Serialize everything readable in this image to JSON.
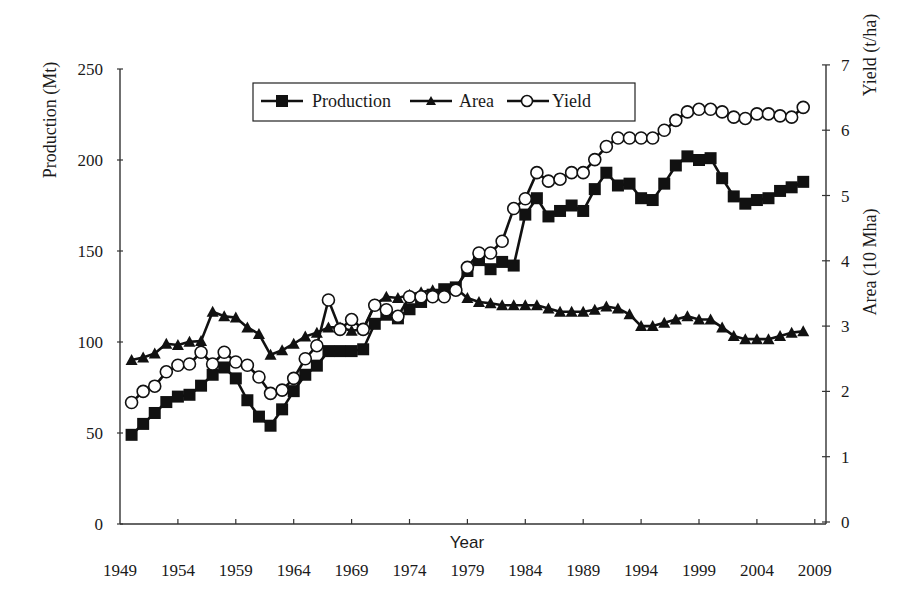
{
  "chart_data": {
    "type": "line",
    "title": "",
    "xlabel": "Year",
    "ylabel_left": "Production (Mt)",
    "ylabel_right_top": "Yield (t/ha)",
    "ylabel_right_bottom": "Area (10 Mha)",
    "xlim": [
      1949,
      2011
    ],
    "ylim_left": [
      0,
      250
    ],
    "ylim_right": [
      0,
      7
    ],
    "x_tick_labels": [
      "1949",
      "1954",
      "1959",
      "1964",
      "1969",
      "1974",
      "1979",
      "1984",
      "1989",
      "1994",
      "1999",
      "2004",
      "2009"
    ],
    "left_tick_labels": [
      "0",
      "50",
      "100",
      "150",
      "200",
      "250"
    ],
    "right_tick_labels": [
      "0",
      "1",
      "2",
      "3",
      "4",
      "5",
      "6",
      "7"
    ],
    "grid": false,
    "legend": {
      "position": "top-center",
      "entries": [
        "Production",
        "Area",
        "Yield"
      ]
    },
    "x": [
      1950,
      1951,
      1952,
      1953,
      1954,
      1955,
      1956,
      1957,
      1958,
      1959,
      1960,
      1961,
      1962,
      1963,
      1964,
      1965,
      1966,
      1967,
      1968,
      1969,
      1970,
      1971,
      1972,
      1973,
      1974,
      1975,
      1976,
      1977,
      1978,
      1979,
      1980,
      1981,
      1982,
      1983,
      1984,
      1985,
      1986,
      1987,
      1988,
      1989,
      1990,
      1991,
      1992,
      1993,
      1994,
      1995,
      1996,
      1997,
      1998,
      1999,
      2000,
      2001,
      2002,
      2003,
      2004,
      2005,
      2006,
      2007,
      2008
    ],
    "series": [
      {
        "name": "Production",
        "axis": "left",
        "marker": "square",
        "values": [
          49,
          55,
          61,
          67,
          70,
          71,
          76,
          82,
          86,
          80,
          68,
          59,
          54,
          63,
          73,
          82,
          87,
          95,
          95,
          95,
          96,
          110,
          115,
          113,
          118,
          122,
          126,
          129,
          130,
          139,
          145,
          140,
          144,
          142,
          170,
          179,
          169,
          172,
          175,
          172,
          184,
          193,
          186,
          187,
          179,
          178,
          187,
          197,
          202,
          200,
          201,
          190,
          180,
          176,
          178,
          179,
          183,
          185,
          188
        ]
      },
      {
        "name": "Area",
        "axis": "right",
        "marker": "triangle",
        "values": [
          2.48,
          2.52,
          2.58,
          2.73,
          2.71,
          2.76,
          2.77,
          3.22,
          3.15,
          3.13,
          2.98,
          2.88,
          2.56,
          2.63,
          2.73,
          2.84,
          2.9,
          2.98,
          2.98,
          2.93,
          2.95,
          3.33,
          3.45,
          3.43,
          3.48,
          3.52,
          3.55,
          3.55,
          3.58,
          3.43,
          3.37,
          3.35,
          3.32,
          3.32,
          3.32,
          3.32,
          3.27,
          3.22,
          3.22,
          3.22,
          3.25,
          3.3,
          3.27,
          3.18,
          3.0,
          3.0,
          3.05,
          3.1,
          3.15,
          3.1,
          3.1,
          2.98,
          2.85,
          2.8,
          2.8,
          2.8,
          2.85,
          2.9,
          2.92
        ]
      },
      {
        "name": "Yield",
        "axis": "right",
        "marker": "circle-open",
        "values": [
          1.83,
          2.0,
          2.08,
          2.3,
          2.4,
          2.42,
          2.6,
          2.42,
          2.6,
          2.45,
          2.4,
          2.22,
          1.97,
          2.02,
          2.2,
          2.5,
          2.7,
          3.4,
          2.95,
          3.1,
          2.95,
          3.32,
          3.25,
          3.15,
          3.45,
          3.45,
          3.45,
          3.45,
          3.55,
          3.9,
          4.12,
          4.12,
          4.3,
          4.8,
          4.95,
          5.35,
          5.22,
          5.25,
          5.35,
          5.35,
          5.55,
          5.75,
          5.88,
          5.88,
          5.88,
          5.88,
          6.0,
          6.15,
          6.28,
          6.32,
          6.32,
          6.28,
          6.2,
          6.18,
          6.25,
          6.25,
          6.22,
          6.2,
          6.35
        ]
      }
    ]
  }
}
